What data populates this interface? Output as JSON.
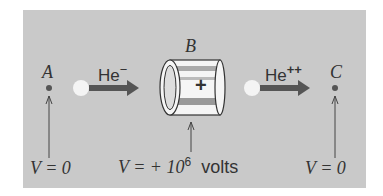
{
  "diagram": {
    "background_color": "#c9c9c9",
    "points": {
      "A": {
        "label": "A",
        "potential": "V = 0"
      },
      "B": {
        "label": "B",
        "potential_prefix": "V = + 10",
        "potential_exponent": "6",
        "unit": "volts",
        "sign": "+"
      },
      "C": {
        "label": "C",
        "potential": "V = 0"
      }
    },
    "beams": [
      {
        "ion": "He",
        "charge": "−"
      },
      {
        "ion": "He",
        "charge": "++"
      }
    ]
  }
}
